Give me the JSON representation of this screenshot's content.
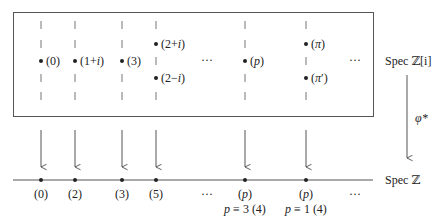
{
  "diagram": {
    "top_space_label": "Spec ℤ[i]",
    "bottom_space_label": "Spec ℤ",
    "map_label": "φ*",
    "ellipsis": "···",
    "columns": [
      {
        "x": 41,
        "top": [
          {
            "row": 2,
            "label": "(0)"
          }
        ],
        "bottom": "(0)",
        "note": ""
      },
      {
        "x": 75,
        "top": [
          {
            "row": 2,
            "label": "(1+i)"
          }
        ],
        "bottom": "(2)",
        "note": ""
      },
      {
        "x": 122,
        "top": [
          {
            "row": 2,
            "label": "(3)"
          }
        ],
        "bottom": "(3)",
        "note": ""
      },
      {
        "x": 156,
        "top": [
          {
            "row": 1,
            "label": "(2+i)"
          },
          {
            "row": 3,
            "label": "(2−i)"
          }
        ],
        "bottom": "(5)",
        "note": ""
      },
      {
        "x": 245,
        "top": [
          {
            "row": 2,
            "label": "(p)"
          }
        ],
        "bottom": "(p)",
        "note": "p ≡ 3 (4)"
      },
      {
        "x": 306,
        "top": [
          {
            "row": 1,
            "label": "(π)"
          },
          {
            "row": 3,
            "label": "(π′)"
          }
        ],
        "bottom": "(p)",
        "note": "p ≡ 1 (4)"
      }
    ],
    "top_ellipses_x": [
      207,
      355
    ],
    "bottom_ellipses_x": [
      207,
      355
    ]
  }
}
